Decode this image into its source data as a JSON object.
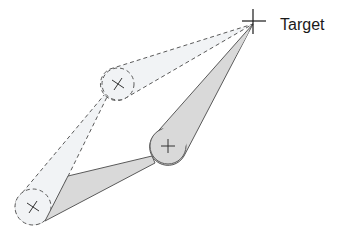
{
  "diagram": {
    "title": "",
    "target": {
      "label": "Target",
      "x": 253,
      "y": 24
    },
    "nodes": [
      {
        "id": "ghost-upper",
        "style": "dashed",
        "x": 118,
        "y": 84,
        "r": 16
      },
      {
        "id": "solid-middle",
        "style": "solid",
        "x": 168,
        "y": 146,
        "r": 18
      },
      {
        "id": "ghost-lower",
        "style": "dashed",
        "x": 33,
        "y": 207,
        "r": 18
      }
    ],
    "links": [
      {
        "from": "ghost-upper",
        "to": "target",
        "style": "dashed"
      },
      {
        "from": "ghost-lower",
        "to": "ghost-upper",
        "style": "dashed"
      },
      {
        "from": "solid-middle",
        "to": "target",
        "style": "solid"
      },
      {
        "from": "ghost-lower",
        "to": "solid-middle",
        "style": "solid"
      }
    ],
    "colors": {
      "solid_fill": "#d9d9d9",
      "solid_stroke": "#5a5a5a",
      "ghost_fill": "#f1f3f5",
      "ghost_stroke": "#5a5a5a",
      "cross": "#333333"
    }
  }
}
